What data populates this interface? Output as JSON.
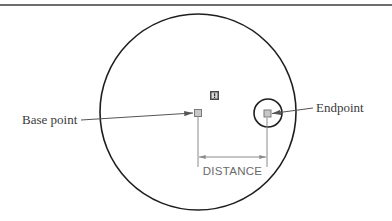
{
  "diagram": {
    "type": "cad-snap-distance-illustration",
    "colors": {
      "stroke": "#1e1e1e",
      "leader": "#555555",
      "dimension": "#8a8a8a",
      "marker_fill": "#c8c8c8",
      "marker_stroke": "#7a7a7a",
      "icon_fill": "#4a4a4a",
      "icon_inner": "#d8d8d8",
      "top_rule": "#3c3c3c"
    },
    "labels": {
      "base_point": "Base point",
      "endpoint": "Endpoint",
      "distance": "DISTANCE"
    },
    "shapes": {
      "outer_circle": {
        "cx": 198,
        "cy": 112,
        "r": 98
      },
      "snap_circle": {
        "cx": 268,
        "cy": 113,
        "r": 14
      },
      "base_point_marker": {
        "x": 194,
        "y": 109,
        "size": 7
      },
      "endpoint_marker": {
        "x": 264,
        "y": 110,
        "size": 7
      },
      "tooltip_icon": {
        "x": 210,
        "y": 91,
        "size": 9
      },
      "dimension_line": {
        "x1": 198,
        "x2": 267,
        "y": 157
      }
    }
  }
}
